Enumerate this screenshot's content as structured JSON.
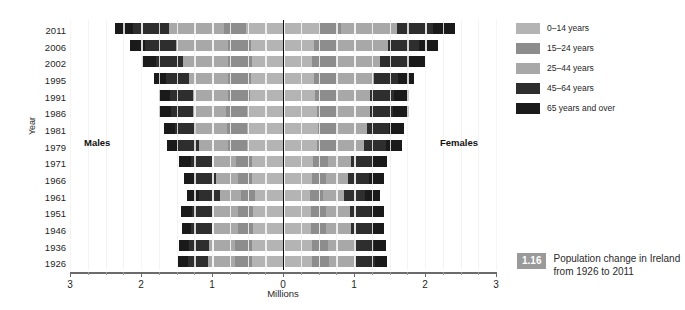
{
  "figure": {
    "caption_number": "1.16",
    "caption_text": "Population change in Ireland from 1926 to 2011"
  },
  "legend": {
    "items": [
      {
        "label": "0–14 years",
        "color": "#b4b4b4"
      },
      {
        "label": "15–24 years",
        "color": "#8d8d8d"
      },
      {
        "label": "25–44 years",
        "color": "#a8a8a8"
      },
      {
        "label": "45–64 years",
        "color": "#2e2e2e"
      },
      {
        "label": "65 years and over",
        "color": "#1a1a1a"
      }
    ]
  },
  "chart_data": {
    "type": "bar",
    "subtype": "population-pyramid-stacked-horizontal",
    "title": "Population change in Ireland from 1926 to 2011",
    "xlabel": "Millions",
    "ylabel": "Year",
    "xlim": [
      -3,
      3
    ],
    "xticks": [
      3,
      2,
      1,
      0,
      1,
      2,
      3
    ],
    "grid": true,
    "legend_position": "right",
    "side_labels": {
      "left": "Males",
      "right": "Females"
    },
    "categories": [
      "2011",
      "2006",
      "2002",
      "1995",
      "1991",
      "1986",
      "1981",
      "1979",
      "1971",
      "1966",
      "1961",
      "1951",
      "1946",
      "1936",
      "1926"
    ],
    "series": [
      {
        "name": "0–14 years",
        "color": "#b4b4b4"
      },
      {
        "name": "15–24 years",
        "color": "#8d8d8d"
      },
      {
        "name": "25–44 years",
        "color": "#a8a8a8"
      },
      {
        "name": "45–64 years",
        "color": "#2e2e2e"
      },
      {
        "name": "65 years and over",
        "color": "#1a1a1a"
      }
    ],
    "units": "millions",
    "rows": [
      {
        "year": "2011",
        "males": {
          "0-14": 0.52,
          "15-24": 0.31,
          "25-44": 0.77,
          "45-64": 0.52,
          "65+": 0.25,
          "total": 2.37
        },
        "females": {
          "0-14": 0.5,
          "15-24": 0.31,
          "25-44": 0.79,
          "45-64": 0.52,
          "65+": 0.3,
          "total": 2.42
        }
      },
      {
        "year": "2006",
        "males": {
          "0-14": 0.45,
          "15-24": 0.33,
          "25-44": 0.73,
          "45-64": 0.44,
          "65+": 0.21,
          "total": 2.16
        },
        "females": {
          "0-14": 0.43,
          "15-24": 0.33,
          "25-44": 0.72,
          "45-64": 0.44,
          "65+": 0.27,
          "total": 2.19
        }
      },
      {
        "year": "2002",
        "males": {
          "0-14": 0.43,
          "15-24": 0.34,
          "25-44": 0.64,
          "45-64": 0.38,
          "65+": 0.19,
          "total": 1.98
        },
        "females": {
          "0-14": 0.41,
          "15-24": 0.33,
          "25-44": 0.63,
          "45-64": 0.38,
          "65+": 0.25,
          "total": 2.0
        }
      },
      {
        "year": "1995",
        "males": {
          "0-14": 0.45,
          "15-24": 0.32,
          "25-44": 0.55,
          "45-64": 0.33,
          "65+": 0.17,
          "total": 1.82
        },
        "females": {
          "0-14": 0.43,
          "15-24": 0.31,
          "25-44": 0.54,
          "45-64": 0.34,
          "65+": 0.23,
          "total": 1.85
        }
      },
      {
        "year": "1991",
        "males": {
          "0-14": 0.47,
          "15-24": 0.3,
          "25-44": 0.5,
          "45-64": 0.32,
          "65+": 0.16,
          "total": 1.75
        },
        "females": {
          "0-14": 0.45,
          "15-24": 0.29,
          "25-44": 0.49,
          "45-64": 0.33,
          "65+": 0.22,
          "total": 1.78
        }
      },
      {
        "year": "1986",
        "males": {
          "0-14": 0.5,
          "15-24": 0.3,
          "25-44": 0.47,
          "45-64": 0.31,
          "65+": 0.16,
          "total": 1.74
        },
        "females": {
          "0-14": 0.48,
          "15-24": 0.29,
          "25-44": 0.46,
          "45-64": 0.32,
          "65+": 0.22,
          "total": 1.77
        }
      },
      {
        "year": "1981",
        "males": {
          "0-14": 0.51,
          "15-24": 0.28,
          "25-44": 0.43,
          "45-64": 0.3,
          "65+": 0.16,
          "total": 1.68
        },
        "females": {
          "0-14": 0.49,
          "15-24": 0.27,
          "25-44": 0.42,
          "45-64": 0.31,
          "65+": 0.22,
          "total": 1.71
        }
      },
      {
        "year": "1979",
        "males": {
          "0-14": 0.5,
          "15-24": 0.27,
          "25-44": 0.41,
          "45-64": 0.3,
          "65+": 0.16,
          "total": 1.64
        },
        "females": {
          "0-14": 0.48,
          "15-24": 0.26,
          "25-44": 0.4,
          "45-64": 0.31,
          "65+": 0.22,
          "total": 1.67
        }
      },
      {
        "year": "1971",
        "males": {
          "0-14": 0.44,
          "15-24": 0.22,
          "25-44": 0.34,
          "45-64": 0.3,
          "65+": 0.16,
          "total": 1.46
        },
        "females": {
          "0-14": 0.42,
          "15-24": 0.21,
          "25-44": 0.33,
          "45-64": 0.3,
          "65+": 0.21,
          "total": 1.47
        }
      },
      {
        "year": "1966",
        "males": {
          "0-14": 0.43,
          "15-24": 0.2,
          "25-44": 0.31,
          "45-64": 0.3,
          "65+": 0.16,
          "total": 1.4
        },
        "females": {
          "0-14": 0.41,
          "15-24": 0.19,
          "25-44": 0.31,
          "45-64": 0.3,
          "65+": 0.21,
          "total": 1.42
        }
      },
      {
        "year": "1961",
        "males": {
          "0-14": 0.4,
          "15-24": 0.19,
          "25-44": 0.3,
          "45-64": 0.3,
          "65+": 0.16,
          "total": 1.35
        },
        "females": {
          "0-14": 0.38,
          "15-24": 0.18,
          "25-44": 0.3,
          "45-64": 0.3,
          "65+": 0.21,
          "total": 1.37
        }
      },
      {
        "year": "1951",
        "males": {
          "0-14": 0.42,
          "15-24": 0.21,
          "25-44": 0.35,
          "45-64": 0.3,
          "65+": 0.15,
          "total": 1.43
        },
        "females": {
          "0-14": 0.4,
          "15-24": 0.2,
          "25-44": 0.34,
          "45-64": 0.3,
          "65+": 0.19,
          "total": 1.43
        }
      },
      {
        "year": "1946",
        "males": {
          "0-14": 0.42,
          "15-24": 0.22,
          "25-44": 0.36,
          "45-64": 0.29,
          "65+": 0.14,
          "total": 1.43
        },
        "females": {
          "0-14": 0.4,
          "15-24": 0.21,
          "25-44": 0.35,
          "45-64": 0.29,
          "65+": 0.18,
          "total": 1.43
        }
      },
      {
        "year": "1936",
        "males": {
          "0-14": 0.43,
          "15-24": 0.24,
          "25-44": 0.37,
          "45-64": 0.28,
          "65+": 0.14,
          "total": 1.46
        },
        "females": {
          "0-14": 0.41,
          "15-24": 0.23,
          "25-44": 0.36,
          "45-64": 0.28,
          "65+": 0.17,
          "total": 1.45
        }
      },
      {
        "year": "1926",
        "males": {
          "0-14": 0.43,
          "15-24": 0.25,
          "25-44": 0.38,
          "45-64": 0.28,
          "65+": 0.14,
          "total": 1.48
        },
        "females": {
          "0-14": 0.41,
          "15-24": 0.24,
          "25-44": 0.37,
          "45-64": 0.28,
          "65+": 0.17,
          "total": 1.47
        }
      }
    ]
  },
  "axes": {
    "y_title": "Year",
    "x_title": "Millions",
    "x_tick_labels": [
      "3",
      "2",
      "1",
      "0",
      "1",
      "2",
      "3"
    ]
  }
}
